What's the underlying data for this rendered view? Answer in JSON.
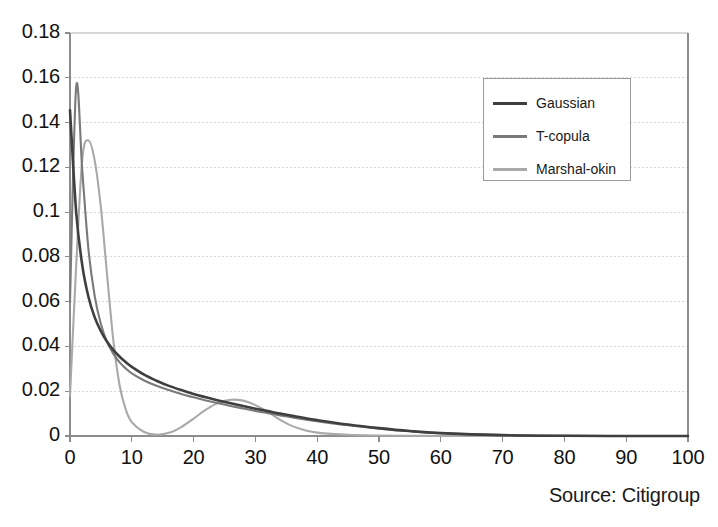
{
  "chart_data": {
    "type": "line",
    "title": "",
    "subtitle": "",
    "xlabel": "",
    "ylabel": "",
    "xlim": [
      0,
      100
    ],
    "ylim": [
      0,
      0.18
    ],
    "grid": true,
    "grid_axis": "y",
    "legend_position": "upper-right",
    "x_ticks": [
      "0",
      "10",
      "20",
      "30",
      "40",
      "50",
      "60",
      "70",
      "80",
      "90",
      "100"
    ],
    "x_tick_values": [
      0,
      10,
      20,
      30,
      40,
      50,
      60,
      70,
      80,
      90,
      100
    ],
    "y_ticks": [
      "0",
      "0.02",
      "0.04",
      "0.06",
      "0.08",
      "0.1",
      "0.12",
      "0.14",
      "0.16",
      "0.18"
    ],
    "y_tick_values": [
      0,
      0.02,
      0.04,
      0.06,
      0.08,
      0.1,
      0.12,
      0.14,
      0.16,
      0.18
    ],
    "x": [
      0,
      1,
      2,
      3,
      4,
      5,
      6,
      7,
      8,
      9,
      10,
      12,
      14,
      16,
      18,
      20,
      22,
      24,
      26,
      28,
      30,
      32,
      34,
      36,
      38,
      40,
      45,
      50,
      55,
      60,
      70,
      80,
      90,
      100
    ],
    "series": [
      {
        "name": "Gaussian",
        "color": "#3f3f3f",
        "values": [
          0.1455,
          0.1,
          0.076,
          0.062,
          0.053,
          0.0468,
          0.0421,
          0.0385,
          0.0355,
          0.033,
          0.0309,
          0.0274,
          0.0247,
          0.0224,
          0.0205,
          0.0188,
          0.0173,
          0.0159,
          0.0146,
          0.0134,
          0.0122,
          0.0111,
          0.01,
          0.009,
          0.008,
          0.0071,
          0.0051,
          0.0035,
          0.0022,
          0.0013,
          0.0004,
          0.0001,
          0.0,
          0.0
        ]
      },
      {
        "name": "T-copula",
        "color": "#7a7a7a",
        "values": [
          0.06,
          0.156,
          0.118,
          0.083,
          0.0625,
          0.05,
          0.042,
          0.0368,
          0.033,
          0.0302,
          0.028,
          0.0248,
          0.0224,
          0.0205,
          0.0188,
          0.0173,
          0.0159,
          0.0146,
          0.0134,
          0.0123,
          0.0112,
          0.0102,
          0.0092,
          0.0083,
          0.0074,
          0.0066,
          0.0048,
          0.0033,
          0.0021,
          0.0012,
          0.0004,
          0.0001,
          0.0,
          0.0
        ]
      },
      {
        "name": "Marshal-okin",
        "color": "#a9a9a9",
        "values": [
          0.018,
          0.076,
          0.124,
          0.132,
          0.123,
          0.102,
          0.072,
          0.043,
          0.023,
          0.012,
          0.0062,
          0.0018,
          0.0006,
          0.0014,
          0.004,
          0.0078,
          0.0118,
          0.0148,
          0.0162,
          0.0158,
          0.0138,
          0.0108,
          0.0072,
          0.0044,
          0.0026,
          0.0015,
          0.0005,
          0.0002,
          0.0001,
          0.0,
          0.0,
          0.0,
          0.0,
          0.0
        ]
      }
    ],
    "annotations": [
      {
        "text": "Source: Citigroup",
        "position": "bottom-right"
      }
    ]
  },
  "legend": {
    "entries": [
      {
        "label": "Gaussian",
        "color": "#3f3f3f"
      },
      {
        "label": "T-copula",
        "color": "#7a7a7a"
      },
      {
        "label": "Marshal-okin",
        "color": "#a9a9a9"
      }
    ]
  },
  "footer": {
    "source": "Source: Citigroup"
  },
  "colors": {
    "gaussian": "#3f3f3f",
    "t_copula": "#7a7a7a",
    "marshal_okin": "#a9a9a9",
    "axis": "#8c8c8c",
    "grid": "#d8d8d8",
    "text": "#1a1a1a"
  }
}
